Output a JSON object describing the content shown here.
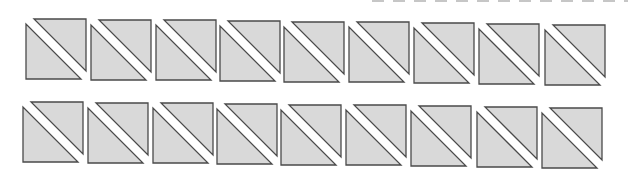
{
  "diagram": {
    "rows": 2,
    "columns": 9,
    "colors": {
      "fill": "#d9d9d9",
      "stroke": "#4a4a4a",
      "gap": "#ffffff",
      "background": "#ffffff",
      "top_dash": "#b8b8b8"
    },
    "square_size": 60,
    "gap_width": 6,
    "squares": [
      {
        "row": 1,
        "col": 1,
        "x": 26,
        "y": 19
      },
      {
        "row": 1,
        "col": 2,
        "x": 91,
        "y": 20
      },
      {
        "row": 1,
        "col": 3,
        "x": 156,
        "y": 20
      },
      {
        "row": 1,
        "col": 4,
        "x": 220,
        "y": 21
      },
      {
        "row": 1,
        "col": 5,
        "x": 284,
        "y": 22
      },
      {
        "row": 1,
        "col": 6,
        "x": 349,
        "y": 22
      },
      {
        "row": 1,
        "col": 7,
        "x": 414,
        "y": 23
      },
      {
        "row": 1,
        "col": 8,
        "x": 479,
        "y": 24
      },
      {
        "row": 1,
        "col": 9,
        "x": 545,
        "y": 25
      },
      {
        "row": 2,
        "col": 1,
        "x": 23,
        "y": 102
      },
      {
        "row": 2,
        "col": 2,
        "x": 88,
        "y": 103
      },
      {
        "row": 2,
        "col": 3,
        "x": 153,
        "y": 103
      },
      {
        "row": 2,
        "col": 4,
        "x": 217,
        "y": 104
      },
      {
        "row": 2,
        "col": 5,
        "x": 281,
        "y": 105
      },
      {
        "row": 2,
        "col": 6,
        "x": 346,
        "y": 105
      },
      {
        "row": 2,
        "col": 7,
        "x": 411,
        "y": 106
      },
      {
        "row": 2,
        "col": 8,
        "x": 477,
        "y": 107
      },
      {
        "row": 2,
        "col": 9,
        "x": 542,
        "y": 108
      }
    ]
  }
}
